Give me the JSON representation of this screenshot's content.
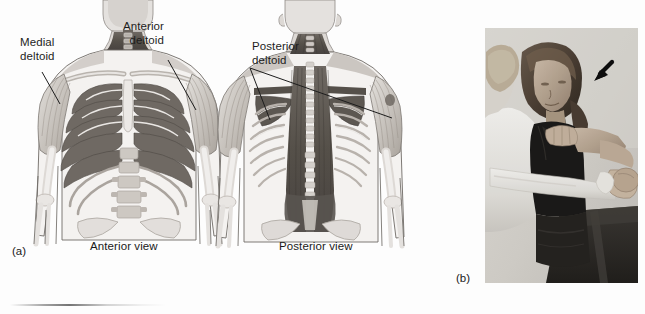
{
  "figure": {
    "background_color": "#fdfdfd",
    "line_color": "#1d1d1d"
  },
  "panel_a": {
    "letter": "(a)",
    "labels": [
      {
        "id": "medial-deltoid",
        "text": "Medial\ndeltoid",
        "align": "left"
      },
      {
        "id": "anterior-deltoid",
        "text": "Anterior\ndeltoid",
        "align": "right"
      },
      {
        "id": "posterior-deltoid",
        "text": "Posterior\ndeltoid",
        "align": "left"
      }
    ],
    "captions": [
      {
        "id": "anterior-view",
        "text": "Anterior view"
      },
      {
        "id": "posterior-view",
        "text": "Posterior view"
      }
    ],
    "illustration": {
      "anterior_view": "skeletal and muscular torso, anterior aspect, deltoid muscles shaded at both shoulders",
      "posterior_view": "skeletal and muscular torso, posterior aspect, erector spinae and posterior deltoid shaded"
    },
    "art_colors": {
      "bone_light": "#eceae8",
      "bone_mid": "#cfcbc7",
      "muscle_light": "#b9b4ae",
      "muscle_mid": "#8d8781",
      "muscle_dark": "#5f5a55",
      "muscle_deep": "#474340",
      "outline": "#4a4744"
    }
  },
  "panel_b": {
    "letter": "(b)",
    "photograph": {
      "description": "Clinician performing a manual shoulder strength test on a seated female subject",
      "arrow": {
        "id": "annotation-arrow",
        "direction": "down-left",
        "color": "#0d0d0d"
      }
    },
    "photo_tones": {
      "wall": "#d7d4cf",
      "skin": "#b9a693",
      "hair": "#4b4038",
      "clinician_sleeve": "#efeeea",
      "tank_top": "#1b1a1a",
      "bench": "#2b2926"
    }
  }
}
